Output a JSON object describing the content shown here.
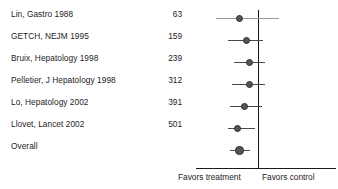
{
  "chart_data": {
    "type": "forest",
    "title": "",
    "xlabel": "",
    "ylabel": "",
    "grid": false,
    "null_value": 1,
    "null_line_label": "no effect",
    "left_axis_caption": "Favors treatment",
    "right_axis_caption": "Favors control",
    "columns": {
      "study": "",
      "count": ""
    },
    "rows": [
      {
        "study": "Lin, Gastro 1988",
        "count": "63",
        "marker_pos": 0.312,
        "ci_low": 0.142,
        "ci_high": 0.596,
        "marker_size": 7.0,
        "crosses_null": true,
        "faint_ci": true,
        "caps": false
      },
      {
        "study": "GETCH, NEJM 1995",
        "count": "159",
        "marker_pos": 0.362,
        "ci_low": 0.227,
        "ci_high": 0.482,
        "marker_size": 7.2,
        "crosses_null": false,
        "faint_ci": false,
        "caps": false
      },
      {
        "study": "Bruix, Hepatology 1998",
        "count": "239",
        "marker_pos": 0.383,
        "ci_low": 0.269,
        "ci_high": 0.496,
        "marker_size": 7.2,
        "crosses_null": false,
        "faint_ci": false,
        "caps": false
      },
      {
        "study": "Pelletier, J Hepatology 1998",
        "count": "312",
        "marker_pos": 0.383,
        "ci_low": 0.255,
        "ci_high": 0.496,
        "marker_size": 7.2,
        "crosses_null": false,
        "faint_ci": false,
        "caps": false
      },
      {
        "study": "Lo, Hepatology 2002",
        "count": "391",
        "marker_pos": 0.347,
        "ci_low": 0.241,
        "ci_high": 0.468,
        "marker_size": 7.2,
        "crosses_null": false,
        "faint_ci": false,
        "caps": false
      },
      {
        "study": "Llovet, Lancet 2002",
        "count": "501",
        "marker_pos": 0.298,
        "ci_low": 0.227,
        "ci_high": 0.425,
        "marker_size": 7.2,
        "crosses_null": false,
        "faint_ci": false,
        "caps": false
      },
      {
        "study": "Overall",
        "count": "",
        "marker_pos": 0.312,
        "ci_low": 0.241,
        "ci_high": 0.383,
        "marker_size": 8.6,
        "crosses_null": false,
        "faint_ci": false,
        "caps": false
      }
    ]
  }
}
